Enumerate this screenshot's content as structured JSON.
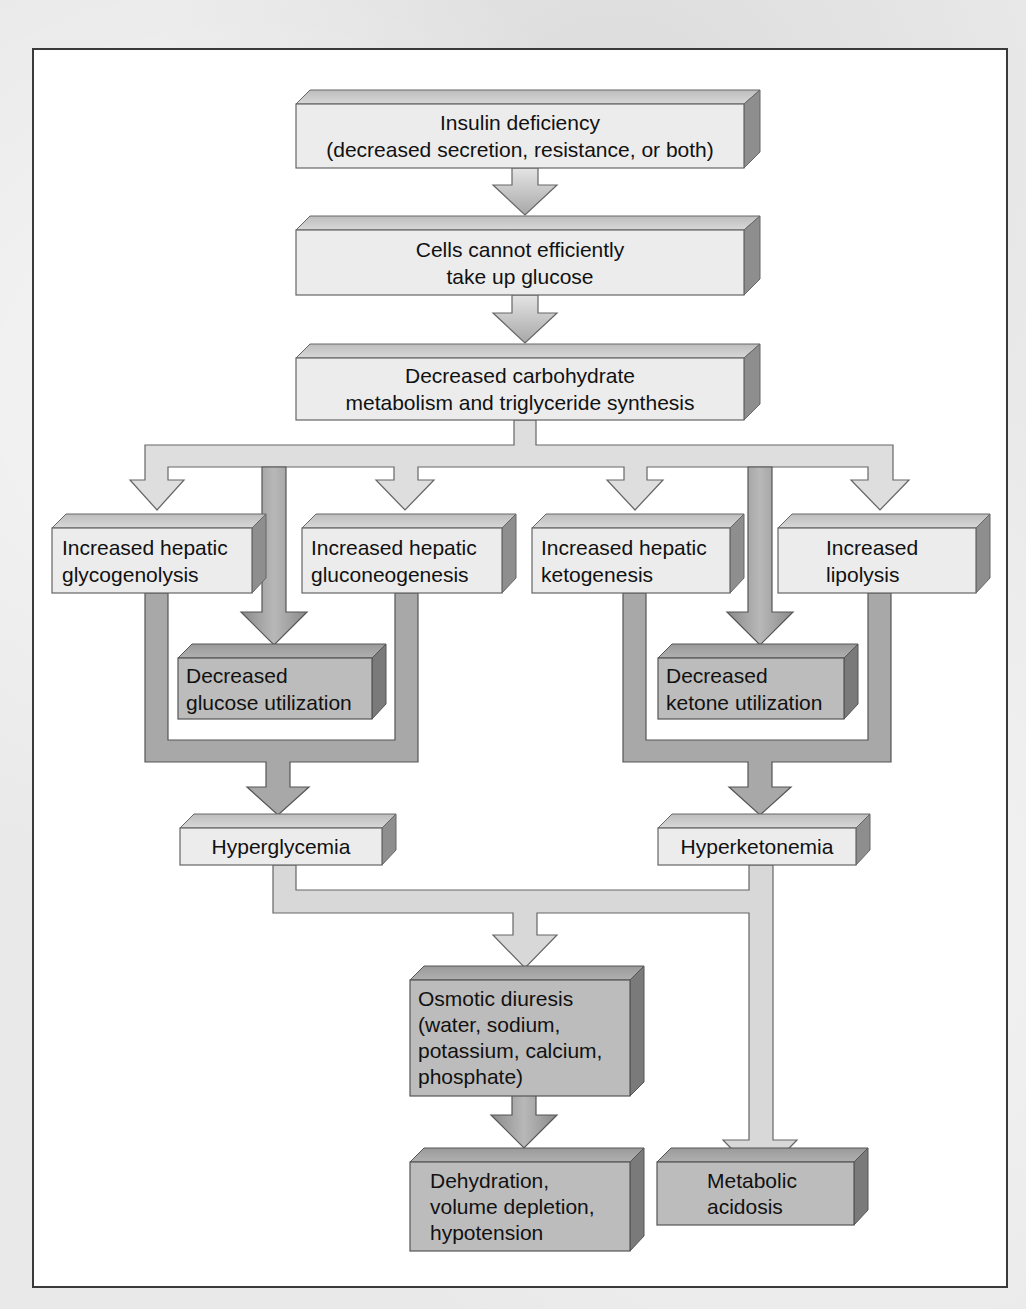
{
  "diagram": {
    "colors": {
      "light_box_face": "#ececec",
      "dark_box_face": "#bcbcbc",
      "light_arrow": "#d6d6d6",
      "dark_arrow": "#8c8c8c",
      "outline": "#555555",
      "frame_border": "#3a3a3a",
      "text": "#111111"
    },
    "nodes": {
      "insulin_deficiency": {
        "lines": [
          "Insulin deficiency",
          "(decreased secretion, resistance, or both)"
        ]
      },
      "cells_cannot_uptake": {
        "lines": [
          "Cells cannot efficiently",
          "take up glucose"
        ]
      },
      "decreased_carb_metabolism": {
        "lines": [
          "Decreased carbohydrate",
          "metabolism and triglyceride synthesis"
        ]
      },
      "hepatic_glycogenolysis": {
        "lines": [
          "Increased hepatic",
          "glycogenolysis"
        ]
      },
      "hepatic_gluconeogenesis": {
        "lines": [
          "Increased hepatic",
          "gluconeogenesis"
        ]
      },
      "hepatic_ketogenesis": {
        "lines": [
          "Increased hepatic",
          "ketogenesis"
        ]
      },
      "increased_lipolysis": {
        "lines": [
          "Increased",
          "lipolysis"
        ]
      },
      "decreased_glucose_utilization": {
        "lines": [
          "Decreased",
          "glucose utilization"
        ]
      },
      "decreased_ketone_utilization": {
        "lines": [
          "Decreased",
          "ketone utilization"
        ]
      },
      "hyperglycemia": {
        "lines": [
          "Hyperglycemia"
        ]
      },
      "hyperketonemia": {
        "lines": [
          "Hyperketonemia"
        ]
      },
      "osmotic_diuresis": {
        "lines": [
          "Osmotic diuresis",
          "(water, sodium,",
          "potassium, calcium,",
          "phosphate)"
        ]
      },
      "dehydration": {
        "lines": [
          "Dehydration,",
          "volume depletion,",
          "hypotension"
        ]
      },
      "metabolic_acidosis": {
        "lines": [
          "Metabolic",
          "acidosis"
        ]
      }
    },
    "edges": [
      {
        "from": "insulin_deficiency",
        "to": "cells_cannot_uptake"
      },
      {
        "from": "cells_cannot_uptake",
        "to": "decreased_carb_metabolism"
      },
      {
        "from": "decreased_carb_metabolism",
        "to": "hepatic_glycogenolysis"
      },
      {
        "from": "decreased_carb_metabolism",
        "to": "decreased_glucose_utilization"
      },
      {
        "from": "decreased_carb_metabolism",
        "to": "hepatic_gluconeogenesis"
      },
      {
        "from": "decreased_carb_metabolism",
        "to": "hepatic_ketogenesis"
      },
      {
        "from": "decreased_carb_metabolism",
        "to": "decreased_ketone_utilization"
      },
      {
        "from": "decreased_carb_metabolism",
        "to": "increased_lipolysis"
      },
      {
        "from": "hepatic_glycogenolysis",
        "to": "hyperglycemia"
      },
      {
        "from": "decreased_glucose_utilization",
        "to": "hyperglycemia"
      },
      {
        "from": "hepatic_gluconeogenesis",
        "to": "hyperglycemia"
      },
      {
        "from": "hepatic_ketogenesis",
        "to": "hyperketonemia"
      },
      {
        "from": "decreased_ketone_utilization",
        "to": "hyperketonemia"
      },
      {
        "from": "increased_lipolysis",
        "to": "hyperketonemia"
      },
      {
        "from": "hyperglycemia",
        "to": "osmotic_diuresis"
      },
      {
        "from": "hyperketonemia",
        "to": "osmotic_diuresis"
      },
      {
        "from": "hyperketonemia",
        "to": "metabolic_acidosis"
      },
      {
        "from": "osmotic_diuresis",
        "to": "dehydration"
      }
    ]
  }
}
